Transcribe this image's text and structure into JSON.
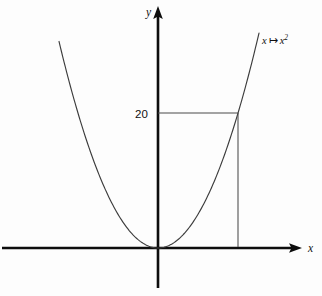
{
  "figure": {
    "name": "parabola-plot",
    "background_color": "#fdfdfd",
    "width": 322,
    "height": 296
  },
  "axes": {
    "x_label": "x",
    "y_label": "y",
    "axis_color": "#0d0d0d",
    "origin": {
      "x": 158,
      "y": 248
    },
    "x_axis": {
      "start_px": 2,
      "end_px": 302,
      "y_px": 248,
      "arrow": "right"
    },
    "y_axis": {
      "top_px": 6,
      "bottom_px": 288,
      "x_px": 158,
      "arrow": "up"
    }
  },
  "ticks": {
    "y": [
      {
        "label": "20",
        "value": 20,
        "y_px": 113
      }
    ]
  },
  "guides": {
    "horizontal": {
      "name": "value-guide-horizontal",
      "from_x_px": 158,
      "to_x_px": 238,
      "y_px": 113,
      "color": "#4a4a4a"
    },
    "vertical": {
      "name": "value-guide-vertical",
      "x_px": 238,
      "from_y_px": 113,
      "to_y_px": 248,
      "color": "#4a4a4a"
    }
  },
  "curve": {
    "label_text": "x",
    "label_maps_to": "↦",
    "label_base": "x",
    "label_exponent": "2",
    "color": "#3c3c3c",
    "left_end_px": {
      "x": 59,
      "y": 42
    },
    "right_end_px": {
      "x": 259,
      "y": 32
    },
    "vertex_px": {
      "x": 158,
      "y": 248
    }
  },
  "chart_data": {
    "type": "line",
    "title": "",
    "subtitle": "",
    "xlabel": "x",
    "ylabel": "y",
    "grid": false,
    "legend": "inline-curve-label",
    "annotations": [
      {
        "text": "x ↦ x²",
        "role": "function-label",
        "x_px": 262,
        "y_px": 40
      },
      {
        "text": "20",
        "role": "y-tick-label",
        "value": 20,
        "x_px": 136,
        "y_px": 118
      }
    ],
    "series": [
      {
        "name": "x ↦ x²",
        "formula": "y = x^2",
        "x": [
          -4.47,
          -4.0,
          -3.5,
          -3.0,
          -2.5,
          -2.0,
          -1.5,
          -1.0,
          -0.5,
          0,
          0.5,
          1.0,
          1.5,
          2.0,
          2.5,
          3.0,
          3.5,
          4.0,
          4.47,
          5.0
        ],
        "values": [
          20.0,
          16.0,
          12.25,
          9.0,
          6.25,
          4.0,
          2.25,
          1.0,
          0.25,
          0,
          0.25,
          1.0,
          2.25,
          4.0,
          6.25,
          9.0,
          12.25,
          16.0,
          20.0,
          25.0
        ]
      }
    ],
    "marked_point": {
      "x": 4.47,
      "y": 20
    },
    "xlim": [
      -5.2,
      5.8
    ],
    "ylim": [
      -2.0,
      27.0
    ]
  }
}
